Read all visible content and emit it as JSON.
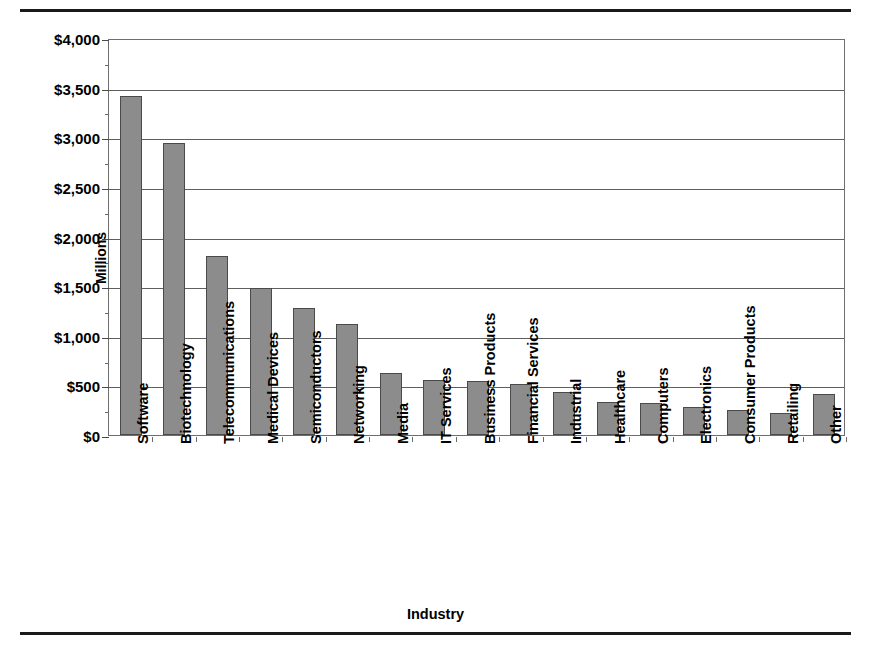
{
  "figure": {
    "top_rule": "",
    "bottom_rule": ""
  },
  "chart_data": {
    "type": "bar",
    "title": "",
    "xlabel": "Industry",
    "ylabel": "Millions",
    "ylim": [
      0,
      4000
    ],
    "ytick_values": [
      0,
      500,
      1000,
      1500,
      2000,
      2500,
      3000,
      3500,
      4000
    ],
    "ytick_labels": [
      "$0",
      "$500",
      "$1,000",
      "$1,500",
      "$2,000",
      "$2,500",
      "$3,000",
      "$3,500",
      "$4,000"
    ],
    "grid": true,
    "legend": null,
    "bar_color": "#8c8c8c",
    "bar_edge_color": "#4a4a4a",
    "categories": [
      "Software",
      "Biotechnology",
      "Telecommunications",
      "Medical Devices",
      "Semiconductors",
      "Networking",
      "Media",
      "IT Services",
      "Business Products",
      "Financial Services",
      "Industrial",
      "Healthcare",
      "Computers",
      "Electronics",
      "Consumer Products",
      "Retailing",
      "Other"
    ],
    "values": [
      3420,
      2940,
      1800,
      1480,
      1280,
      1120,
      620,
      550,
      540,
      510,
      430,
      330,
      320,
      280,
      250,
      220,
      410
    ]
  }
}
